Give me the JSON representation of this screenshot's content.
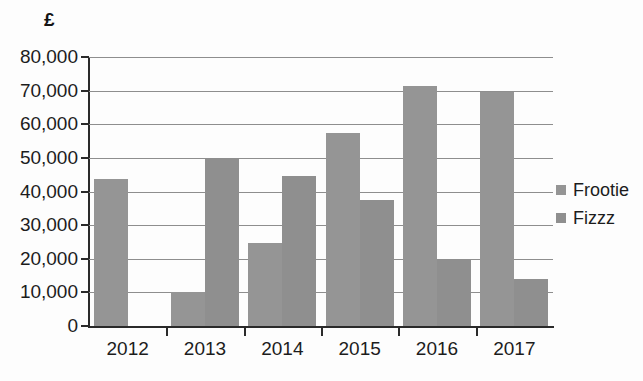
{
  "chart_data": {
    "type": "bar",
    "title": "",
    "subtitle": "",
    "xlabel": "",
    "ylabel": "£",
    "categories": [
      "2012",
      "2013",
      "2014",
      "2015",
      "2016",
      "2017"
    ],
    "series": [
      {
        "name": "Frootie",
        "values": [
          43800,
          10000,
          24800,
          57500,
          71500,
          69500
        ],
        "color": "#959595"
      },
      {
        "name": "Fizzz",
        "values": [
          0,
          49700,
          44500,
          37500,
          19500,
          14000
        ],
        "color": "#8f8f8f"
      }
    ],
    "ylim": [
      0,
      80000
    ],
    "ytick_values": [
      0,
      10000,
      20000,
      30000,
      40000,
      50000,
      60000,
      70000,
      80000
    ],
    "ytick_labels": [
      "0",
      "10,000",
      "20,000",
      "30,000",
      "40,000",
      "50,000",
      "60,000",
      "70,000",
      "80,000"
    ],
    "grid": true,
    "grid_axis": "y",
    "legend_position": "right",
    "legend_entries": [
      "Frootie",
      "Fizzz"
    ],
    "background_color": "#fdfdfd",
    "axis_color": "#2a2a2a",
    "gridline_color": "#8e8e8e"
  }
}
